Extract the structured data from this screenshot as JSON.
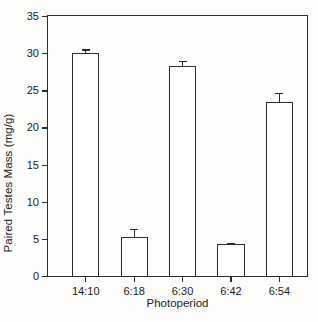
{
  "chart_data": {
    "type": "bar",
    "title": "",
    "subtitle": "",
    "xlabel": "Photoperiod",
    "ylabel": "Paired Testes Mass (mg/g)",
    "categories": [
      "14:10",
      "6:18",
      "6:30",
      "6:42",
      "6:54"
    ],
    "values": [
      30.0,
      5.2,
      28.3,
      4.3,
      23.4
    ],
    "errors": [
      0.5,
      1.1,
      0.7,
      0.2,
      1.3
    ],
    "error_type": "SEM",
    "ylim": [
      0,
      35
    ],
    "yticks": [
      0,
      5,
      10,
      15,
      20,
      25,
      30,
      35
    ],
    "ytick_labels": [
      "0",
      "5",
      "10",
      "15",
      "20",
      "25",
      "30",
      "35"
    ],
    "xtick_labels": [
      "14:10",
      "6:18",
      "6:30",
      "6:42",
      "6:54"
    ],
    "grid": false,
    "legend": null,
    "legend_position": "none",
    "bar_fill": "#ffffff",
    "bar_edge_color": "#2b2b2b",
    "axis_color": "#2b2b2b",
    "background": "#fdfdfc",
    "frame": "box",
    "tick_direction": "out",
    "annotations": []
  }
}
